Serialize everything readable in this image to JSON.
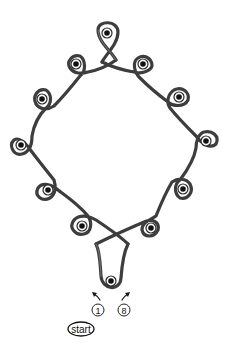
{
  "diagram": {
    "colors": {
      "cord": "#3d3d3d",
      "eyelet_ring": "#ffffff",
      "eyelet_center": "#111111",
      "background": "#ffffff"
    },
    "eyelets": [
      {
        "id": "top",
        "x": 107,
        "y": 33
      },
      {
        "id": "left-1",
        "x": 76,
        "y": 64
      },
      {
        "id": "left-2",
        "x": 42,
        "y": 99
      },
      {
        "id": "left-3",
        "x": 21,
        "y": 145
      },
      {
        "id": "left-4",
        "x": 48,
        "y": 190
      },
      {
        "id": "left-5",
        "x": 82,
        "y": 226
      },
      {
        "id": "bottom",
        "x": 111,
        "y": 281
      },
      {
        "id": "right-5",
        "x": 151,
        "y": 228
      },
      {
        "id": "right-4",
        "x": 183,
        "y": 189
      },
      {
        "id": "right-3",
        "x": 206,
        "y": 141
      },
      {
        "id": "right-2",
        "x": 179,
        "y": 97
      },
      {
        "id": "right-1",
        "x": 143,
        "y": 64
      }
    ],
    "labels": {
      "step_first": "1",
      "step_last": "8",
      "start": "start"
    }
  }
}
